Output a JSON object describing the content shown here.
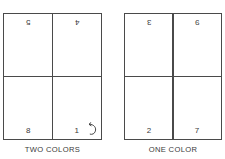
{
  "figure": {
    "background": "#ffffff",
    "line_color": "#4a4a4a",
    "text_color": "#3a3a3a"
  },
  "panels": [
    {
      "id": "two-colors",
      "caption": "TWO COLORS",
      "quadrants": [
        {
          "position": "top-left",
          "value": "5",
          "orientation": "rotated-180"
        },
        {
          "position": "top-right",
          "value": "4",
          "orientation": "rotated-180"
        },
        {
          "position": "bottom-left",
          "value": "8",
          "orientation": "upright"
        },
        {
          "position": "bottom-right",
          "value": "1",
          "orientation": "upright"
        }
      ],
      "annotation": {
        "icon": "rotate-arrow-icon",
        "location": "bottom-right"
      }
    },
    {
      "id": "one-color",
      "caption": "ONE COLOR",
      "quadrants": [
        {
          "position": "top-left",
          "value": "3",
          "orientation": "rotated-180"
        },
        {
          "position": "top-right",
          "value": "9",
          "orientation": "rotated-180"
        },
        {
          "position": "bottom-left",
          "value": "2",
          "orientation": "upright"
        },
        {
          "position": "bottom-right",
          "value": "7",
          "orientation": "upright"
        }
      ]
    }
  ]
}
